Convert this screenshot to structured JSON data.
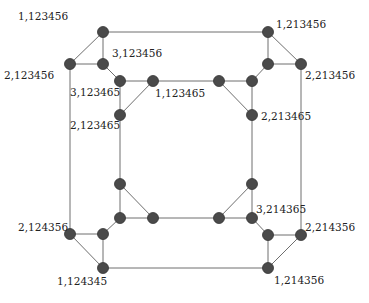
{
  "diagram": {
    "type": "graph",
    "nodes": [
      {
        "id": "A",
        "x": 103,
        "y": 32,
        "label": "1,123456",
        "lx": 18,
        "ly": 20,
        "anchor": "start"
      },
      {
        "id": "B",
        "x": 70,
        "y": 64,
        "label": "2,123456",
        "lx": 4,
        "ly": 79,
        "anchor": "start"
      },
      {
        "id": "C",
        "x": 103,
        "y": 64,
        "label": "3,123456",
        "lx": 112,
        "ly": 57,
        "anchor": "start"
      },
      {
        "id": "D",
        "x": 120,
        "y": 81,
        "label": "3,123465",
        "lx": 70,
        "ly": 96,
        "anchor": "start"
      },
      {
        "id": "E",
        "x": 153,
        "y": 81,
        "label": "1,123465",
        "lx": 155,
        "ly": 97,
        "anchor": "start"
      },
      {
        "id": "F",
        "x": 120,
        "y": 115,
        "label": "2,123465",
        "lx": 70,
        "ly": 129,
        "anchor": "start"
      },
      {
        "id": "G",
        "x": 219,
        "y": 81,
        "label": "",
        "lx": 0,
        "ly": 0,
        "anchor": "start"
      },
      {
        "id": "H",
        "x": 252,
        "y": 81,
        "label": "",
        "lx": 0,
        "ly": 0,
        "anchor": "start"
      },
      {
        "id": "I",
        "x": 252,
        "y": 115,
        "label": "2,213465",
        "lx": 261,
        "ly": 120,
        "anchor": "start"
      },
      {
        "id": "J",
        "x": 268,
        "y": 32,
        "label": "1,213456",
        "lx": 276,
        "ly": 28,
        "anchor": "start"
      },
      {
        "id": "K",
        "x": 268,
        "y": 64,
        "label": "",
        "lx": 0,
        "ly": 0,
        "anchor": "start"
      },
      {
        "id": "L",
        "x": 301,
        "y": 64,
        "label": "2,213456",
        "lx": 305,
        "ly": 79,
        "anchor": "start"
      },
      {
        "id": "M",
        "x": 120,
        "y": 184,
        "label": "",
        "lx": 0,
        "ly": 0,
        "anchor": "start"
      },
      {
        "id": "N",
        "x": 120,
        "y": 218,
        "label": "",
        "lx": 0,
        "ly": 0,
        "anchor": "start"
      },
      {
        "id": "O",
        "x": 153,
        "y": 218,
        "label": "",
        "lx": 0,
        "ly": 0,
        "anchor": "start"
      },
      {
        "id": "P",
        "x": 70,
        "y": 234,
        "label": "2,124356",
        "lx": 18,
        "ly": 231,
        "anchor": "start"
      },
      {
        "id": "Q",
        "x": 103,
        "y": 234,
        "label": "",
        "lx": 0,
        "ly": 0,
        "anchor": "start"
      },
      {
        "id": "R",
        "x": 103,
        "y": 268,
        "label": "1,124345",
        "lx": 57,
        "ly": 285,
        "anchor": "start"
      },
      {
        "id": "S",
        "x": 252,
        "y": 184,
        "label": "",
        "lx": 0,
        "ly": 0,
        "anchor": "start"
      },
      {
        "id": "T",
        "x": 219,
        "y": 218,
        "label": "",
        "lx": 0,
        "ly": 0,
        "anchor": "start"
      },
      {
        "id": "U",
        "x": 252,
        "y": 218,
        "label": "3,214365",
        "lx": 256,
        "ly": 213,
        "anchor": "start"
      },
      {
        "id": "V",
        "x": 268,
        "y": 235,
        "label": "",
        "lx": 0,
        "ly": 0,
        "anchor": "start"
      },
      {
        "id": "W",
        "x": 301,
        "y": 235,
        "label": "2,214356",
        "lx": 305,
        "ly": 231,
        "anchor": "start"
      },
      {
        "id": "X",
        "x": 268,
        "y": 268,
        "label": "1,214356",
        "lx": 274,
        "ly": 284,
        "anchor": "start"
      }
    ],
    "edges": [
      [
        "A",
        "B"
      ],
      [
        "A",
        "C"
      ],
      [
        "B",
        "C"
      ],
      [
        "C",
        "D"
      ],
      [
        "D",
        "E"
      ],
      [
        "D",
        "F"
      ],
      [
        "E",
        "F"
      ],
      [
        "A",
        "J"
      ],
      [
        "E",
        "G"
      ],
      [
        "J",
        "K"
      ],
      [
        "J",
        "L"
      ],
      [
        "K",
        "L"
      ],
      [
        "K",
        "H"
      ],
      [
        "H",
        "G"
      ],
      [
        "H",
        "I"
      ],
      [
        "G",
        "I"
      ],
      [
        "B",
        "P"
      ],
      [
        "F",
        "M"
      ],
      [
        "L",
        "W"
      ],
      [
        "I",
        "S"
      ],
      [
        "M",
        "N"
      ],
      [
        "M",
        "O"
      ],
      [
        "N",
        "O"
      ],
      [
        "N",
        "Q"
      ],
      [
        "Q",
        "P"
      ],
      [
        "Q",
        "R"
      ],
      [
        "P",
        "R"
      ],
      [
        "O",
        "T"
      ],
      [
        "R",
        "X"
      ],
      [
        "S",
        "T"
      ],
      [
        "S",
        "U"
      ],
      [
        "T",
        "U"
      ],
      [
        "U",
        "V"
      ],
      [
        "V",
        "W"
      ],
      [
        "V",
        "X"
      ],
      [
        "W",
        "X"
      ]
    ],
    "colors": {
      "node": "#4a4a4a",
      "edge": "#6e6e6e",
      "text": "#222222",
      "background": "#ffffff"
    }
  }
}
